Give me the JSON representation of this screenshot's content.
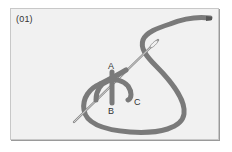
{
  "diagram": {
    "step_label": "(01)",
    "points": {
      "a": "A",
      "b": "B",
      "c": "C"
    },
    "colors": {
      "background": "#f1f1f1",
      "thread": "#7a7a7a",
      "needle": "#888888",
      "text": "#333333"
    }
  }
}
